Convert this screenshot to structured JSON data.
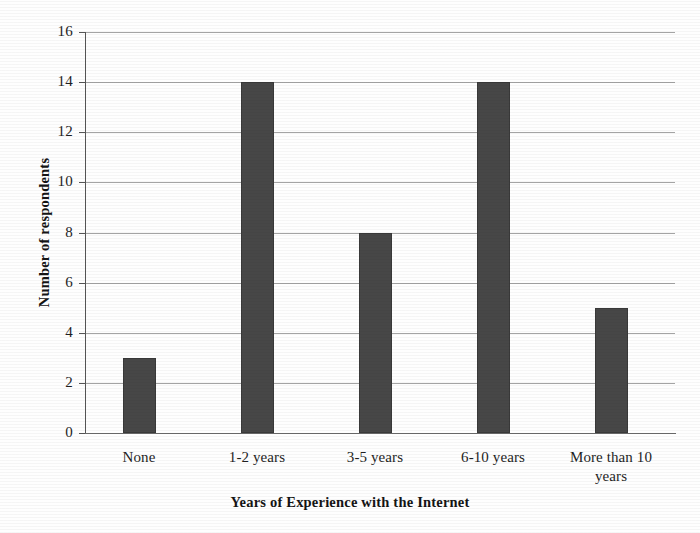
{
  "chart_data": {
    "type": "bar",
    "title": "",
    "categories": [
      "None",
      "1-2 years",
      "3-5 years",
      "6-10 years",
      "More than 10 years"
    ],
    "values": [
      3,
      14,
      8,
      14,
      5
    ],
    "xlabel": "Years of Experience with the Internet",
    "ylabel": "Number of respondents",
    "ylim": [
      0,
      16
    ],
    "ytick_step": 2,
    "yticks": [
      0,
      2,
      4,
      6,
      8,
      10,
      12,
      14,
      16
    ],
    "ytick_labels": [
      "0",
      "2",
      "4",
      "6",
      "8",
      "10",
      "12",
      "14",
      "16"
    ],
    "grid": true,
    "grid_axis": "y",
    "legend": false,
    "bar_color": "#474747",
    "axis_color": "#555555",
    "gridline_color": "#8a8a8a",
    "text_color": "#1f1f1f",
    "series": [
      {
        "name": "Number of respondents",
        "values": [
          3,
          14,
          8,
          14,
          5
        ]
      }
    ],
    "category_labels_multiline": [
      [
        "None"
      ],
      [
        "1-2 years"
      ],
      [
        "3-5 years"
      ],
      [
        "6-10 years"
      ],
      [
        "More than 10",
        "years"
      ]
    ]
  }
}
